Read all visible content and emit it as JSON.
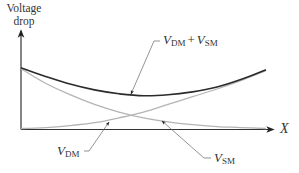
{
  "diagram": {
    "y_axis_label_line1": "Voltage",
    "y_axis_label_line2": "drop",
    "x_axis_label": "X",
    "labels": {
      "sum": {
        "main1": "V",
        "sub1": "DM",
        "plus": "+",
        "main2": "V",
        "sub2": "SM"
      },
      "vdm": {
        "main": "V",
        "sub": "DM"
      },
      "vsm": {
        "main": "V",
        "sub": "SM"
      }
    },
    "colors": {
      "axis": "#333333",
      "sum_curve": "#2b2b2b",
      "component_curves": "#b4b4b4",
      "leader": "#666666"
    }
  },
  "chart_data": {
    "type": "line",
    "title": "",
    "xlabel": "X",
    "ylabel": "Voltage drop",
    "x": [
      0,
      0.1,
      0.2,
      0.3,
      0.4,
      0.5,
      0.6,
      0.7,
      0.8,
      0.9,
      1.0
    ],
    "series": [
      {
        "name": "V_DM + V_SM",
        "values": [
          0.64,
          0.55,
          0.47,
          0.41,
          0.37,
          0.35,
          0.36,
          0.39,
          0.44,
          0.52,
          0.62
        ]
      },
      {
        "name": "V_SM",
        "values": [
          0.63,
          0.48,
          0.36,
          0.26,
          0.18,
          0.12,
          0.08,
          0.05,
          0.03,
          0.02,
          0.01
        ]
      },
      {
        "name": "V_DM",
        "values": [
          0.01,
          0.02,
          0.04,
          0.07,
          0.12,
          0.18,
          0.26,
          0.34,
          0.42,
          0.51,
          0.61
        ]
      }
    ],
    "xlim": [
      0,
      1.1
    ],
    "ylim": [
      0,
      1
    ],
    "grid": false,
    "legend": "none"
  }
}
